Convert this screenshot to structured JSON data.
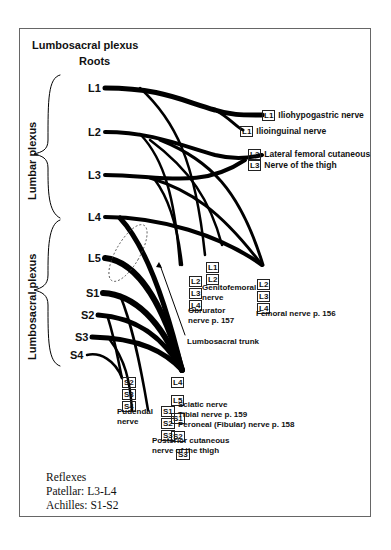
{
  "title": "Lumbosacral plexus",
  "roots_header": "Roots",
  "group_labels": {
    "lumbar": "Lumbar plexus",
    "lumbosacral": "Lumbosacral plexus"
  },
  "roots": [
    "L1",
    "L2",
    "L3",
    "L4",
    "L5",
    "S1",
    "S2",
    "S3",
    "S4"
  ],
  "nerves": {
    "iliohypogastric": {
      "segments": [
        "L1"
      ],
      "label": "Iliohypogastric nerve"
    },
    "ilioinguinal": {
      "segments": [
        "L1"
      ],
      "label": "Ilioinguinal nerve"
    },
    "lateral_femoral": {
      "segments": [
        "L2",
        "L3"
      ],
      "label_line1": "Lateral femoral cutaneous",
      "label_line2": "Nerve of the thigh"
    },
    "genitofemoral": {
      "segments": [
        "L1",
        "L2"
      ],
      "label_line1": "Genitofemoral",
      "label_line2": "nerve"
    },
    "obturator": {
      "segments": [
        "L2",
        "L3",
        "L4"
      ],
      "label_line1": "Obrurator",
      "label_line2": "nerve p. 157"
    },
    "femoral": {
      "segments": [
        "L2",
        "L3",
        "L4"
      ],
      "label": "Femoral nerve p. 156"
    },
    "lumbosacral_trunk": {
      "label": "Lumbosacral trunk"
    },
    "sciatic": {
      "segments": [
        "L4",
        "L5",
        "S1",
        "S2",
        "S3"
      ],
      "label_line1": "Sciatic nerve",
      "label_line2": "Tibial nerve p. 159",
      "label_line3": "Peroneal (Fibular) nerve p. 158"
    },
    "pudendal": {
      "segments": [
        "S2",
        "S3",
        "S4"
      ],
      "label_line1": "Pudendal",
      "label_line2": "nerve"
    },
    "posterior_cutaneous": {
      "segments": [
        "S1",
        "S2",
        "S3"
      ],
      "label_line1": "Posterior cutaneous",
      "label_line2": "nerve of the thigh"
    }
  },
  "reflexes": {
    "header": "Reflexes",
    "patellar": "Patellar: L3-L4",
    "achilles": "Achilles: S1-S2"
  }
}
